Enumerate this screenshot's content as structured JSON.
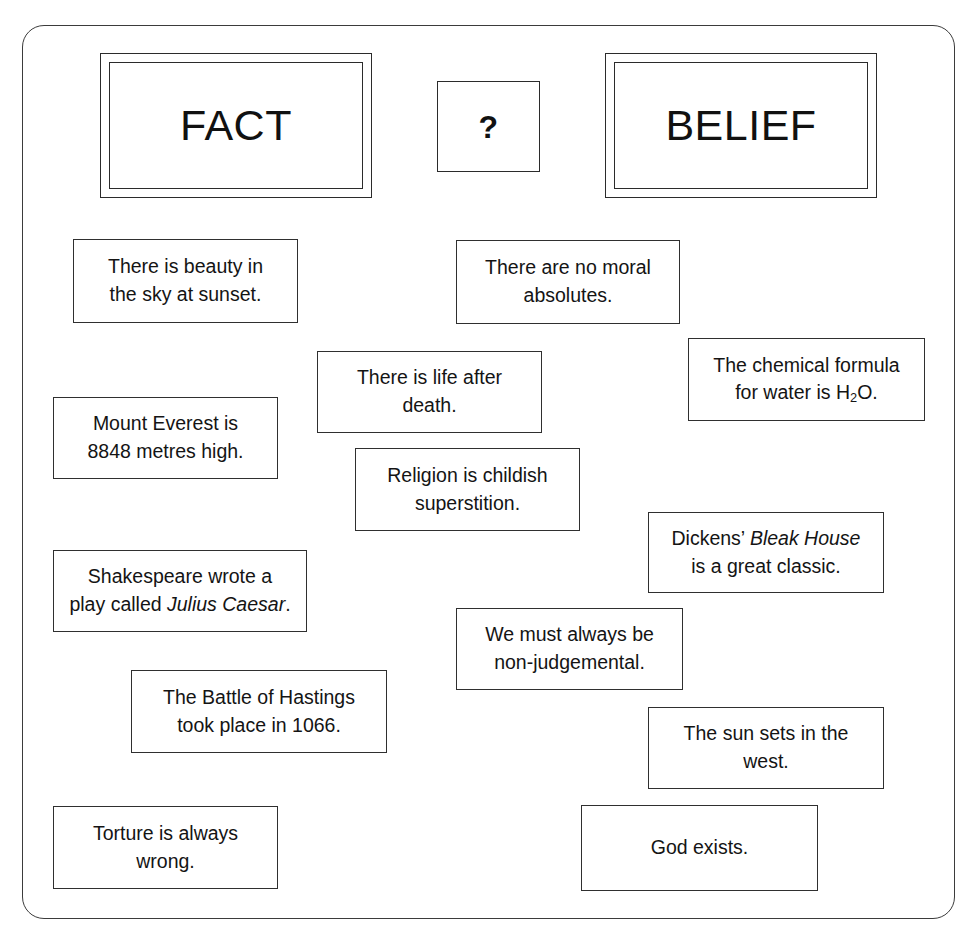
{
  "frame": {
    "shape": "rounded-rectangle"
  },
  "header": {
    "cards": [
      {
        "name": "fact",
        "label": "FACT",
        "double_border": true
      },
      {
        "name": "question",
        "label": "?",
        "double_border": false
      },
      {
        "name": "belief",
        "label": "BELIEF",
        "double_border": true
      }
    ]
  },
  "statements": [
    {
      "id": "beauty-sky",
      "lines": [
        "There is beauty in",
        "the sky at sunset."
      ]
    },
    {
      "id": "no-moral-absolutes",
      "lines": [
        "There are no moral",
        "absolutes."
      ]
    },
    {
      "id": "life-after-death",
      "lines": [
        "There is life after",
        "death."
      ]
    },
    {
      "id": "water-formula",
      "lines": [
        "The chemical formula",
        "for water is H2O."
      ],
      "html": "The chemical formula<br>for water is H<sub>2</sub>O."
    },
    {
      "id": "mount-everest",
      "lines": [
        "Mount Everest is",
        "8848 metres high."
      ]
    },
    {
      "id": "religion-superstition",
      "lines": [
        "Religion is childish",
        "superstition."
      ]
    },
    {
      "id": "dickens-bleak-house",
      "lines": [
        "Dickens’ Bleak House",
        "is a great classic."
      ],
      "html": "Dickens’ <i>Bleak House</i><br>is a great classic."
    },
    {
      "id": "shakespeare-julius-caesar",
      "lines": [
        "Shakespeare wrote a",
        "play called Julius Caesar."
      ],
      "html": "Shakespeare wrote a<br>play called <i>Julius Caesar</i>."
    },
    {
      "id": "non-judgemental",
      "lines": [
        "We must always be",
        "non-judgemental."
      ]
    },
    {
      "id": "battle-of-hastings",
      "lines": [
        "The Battle of Hastings",
        "took place in 1066."
      ]
    },
    {
      "id": "sun-sets-west",
      "lines": [
        "The sun sets in the",
        "west."
      ]
    },
    {
      "id": "torture-wrong",
      "lines": [
        "Torture is always",
        "wrong."
      ]
    },
    {
      "id": "god-exists",
      "lines": [
        "God exists."
      ]
    }
  ],
  "colors": {
    "background": "#ffffff",
    "border": "#2f2f2f",
    "frame_border": "#3b3b3b",
    "text": "#141414"
  }
}
